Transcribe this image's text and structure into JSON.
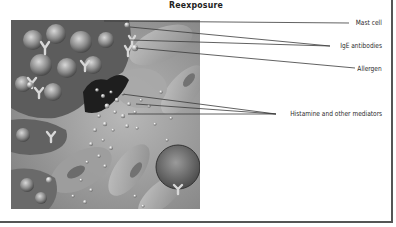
{
  "figure": {
    "title": "Reexposure",
    "illustration": {
      "subject": "mast cell degranulation on reexposure to allergen",
      "style": "grayscale airbrush illustration"
    },
    "labels": [
      {
        "id": "mast-cell",
        "text": "Mast cell"
      },
      {
        "id": "ige-antibodies",
        "text": "IgE antibodies"
      },
      {
        "id": "allergen",
        "text": "Allergen"
      },
      {
        "id": "histamine",
        "text": "Histamine and other mediators"
      }
    ]
  },
  "colors": {
    "frame": "#555555",
    "text": "#2a2a2a",
    "leader_line": "#3a3a3a",
    "background": "#ffffff"
  }
}
